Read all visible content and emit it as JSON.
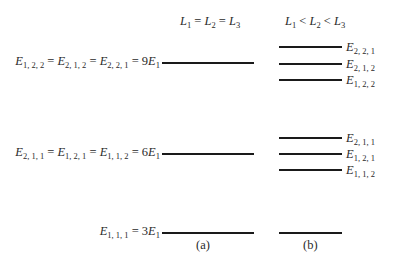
{
  "headers": {
    "a": {
      "parts": [
        "L",
        "1",
        " = ",
        "L",
        "2",
        " = ",
        "L",
        "3"
      ],
      "text": "L1 = L2 = L3"
    },
    "b": {
      "parts": [
        "L",
        "1",
        " < ",
        "L",
        "2",
        " < ",
        "L",
        "3"
      ],
      "text": "L1 < L2 < L3"
    }
  },
  "levels_a": [
    {
      "id": "level-9E1",
      "label": "E1,2,2 = E2,1,2 = E2,2,1 = 9E1",
      "terms": [
        {
          "sub": "1, 2, 2"
        },
        {
          "sub": "2, 1, 2"
        },
        {
          "sub": "2, 2, 1"
        }
      ],
      "value": "9",
      "unit_sub": "1",
      "y": 62
    },
    {
      "id": "level-6E1",
      "label": "E2,1,1 = E1,2,1 = E1,1,2 = 6E1",
      "terms": [
        {
          "sub": "2, 1, 1"
        },
        {
          "sub": "1, 2, 1"
        },
        {
          "sub": "1, 1, 2"
        }
      ],
      "value": "6",
      "unit_sub": "1",
      "y": 153
    },
    {
      "id": "level-3E1",
      "label": "E1,1,1 = 3E1",
      "terms": [
        {
          "sub": "1, 1, 1"
        }
      ],
      "value": "3",
      "unit_sub": "1",
      "y": 232
    }
  ],
  "levels_b": [
    {
      "label_sub": "2, 2, 1",
      "y": 46
    },
    {
      "label_sub": "2, 1, 2",
      "y": 63
    },
    {
      "label_sub": "1, 2, 2",
      "y": 79
    },
    {
      "label_sub": "2, 1, 1",
      "y": 137
    },
    {
      "label_sub": "1, 2, 1",
      "y": 153
    },
    {
      "label_sub": "1, 1, 2",
      "y": 169
    },
    {
      "label_sub": "",
      "y": 232
    }
  ],
  "captions": {
    "a": "(a)",
    "b": "(b)"
  },
  "symbols": {
    "energy": "E",
    "length": "L",
    "equals": " = ",
    "less": " < "
  }
}
